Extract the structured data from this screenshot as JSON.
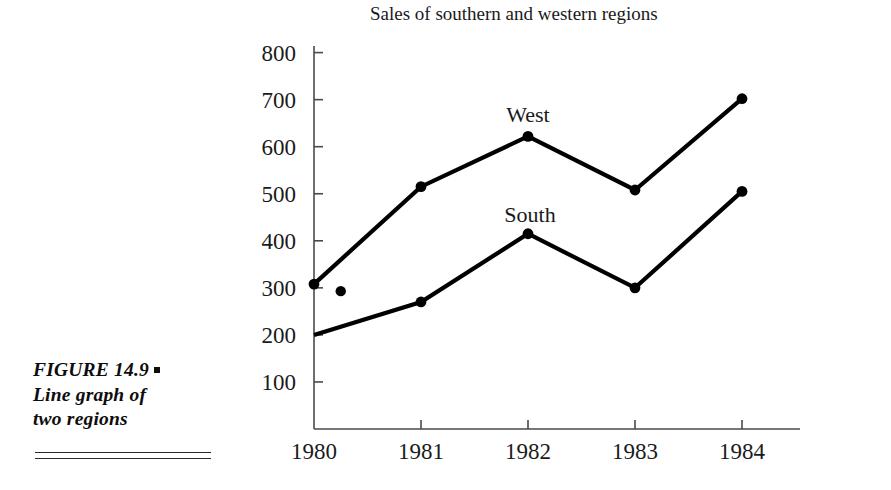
{
  "figure": {
    "caption_lines": [
      "FIGURE  14.9",
      "Line graph of",
      "two regions"
    ],
    "caption_bullet": "square-bullet"
  },
  "chart_data": {
    "type": "line",
    "title": "Sales of southern and western regions",
    "xlabel": "",
    "ylabel": "",
    "x": [
      "1980",
      "1981",
      "1982",
      "1983",
      "1984"
    ],
    "categories": [
      "1980",
      "1981",
      "1982",
      "1983",
      "1984"
    ],
    "xlim": [
      1980,
      1984
    ],
    "ylim": [
      0,
      800
    ],
    "yticks": [
      100,
      200,
      300,
      400,
      500,
      600,
      700,
      800
    ],
    "ytick_labels": [
      "100",
      "200",
      "300",
      "400",
      "500",
      "600",
      "700",
      "800"
    ],
    "grid": false,
    "legend": "inline-labels",
    "marker": "filled-circle",
    "series": [
      {
        "name": "West",
        "label": "West",
        "color": "#000000",
        "values": [
          308,
          515,
          622,
          508,
          702
        ],
        "markers": [
          true,
          true,
          true,
          true,
          true
        ]
      },
      {
        "name": "South",
        "label": "South",
        "color": "#000000",
        "values": [
          200,
          270,
          415,
          300,
          505
        ],
        "markers": [
          false,
          true,
          true,
          true,
          true
        ]
      }
    ],
    "annotations": [
      {
        "name": "stray-dot",
        "x": 1980.25,
        "y": 293,
        "note": "isolated filled dot near 1980"
      }
    ]
  }
}
